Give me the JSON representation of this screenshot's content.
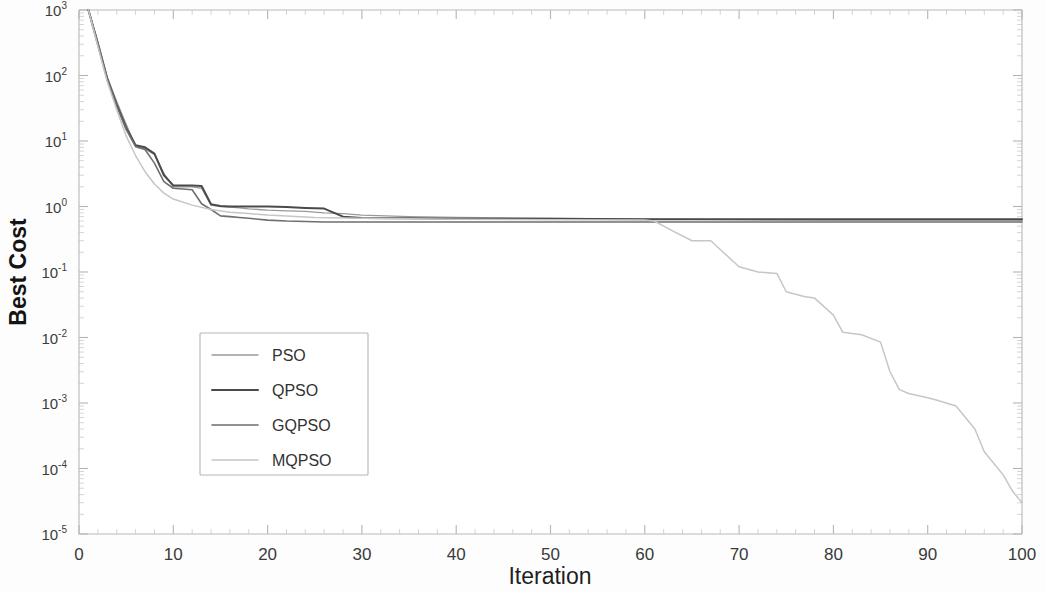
{
  "chart_data": {
    "type": "line",
    "title": "",
    "xlabel": "Iteration",
    "ylabel": "Best Cost",
    "yscale": "log",
    "xlim": [
      0,
      100
    ],
    "ylim": [
      1e-05,
      1000
    ],
    "grid": false,
    "legend_position": "center-left",
    "xtick_labels": [
      "0",
      "10",
      "20",
      "30",
      "40",
      "50",
      "60",
      "70",
      "80",
      "90",
      "100"
    ],
    "xticks": [
      0,
      10,
      20,
      30,
      40,
      50,
      60,
      70,
      80,
      90,
      100
    ],
    "ytick_labels": [
      "10-5",
      "10-4",
      "10-3",
      "10-2",
      "10-1",
      "100",
      "101",
      "102",
      "103"
    ],
    "ytick_mantissa": "10",
    "ytick_exponents": [
      "-5",
      "-4",
      "-3",
      "-2",
      "-1",
      "0",
      "1",
      "2",
      "3"
    ],
    "yticks": [
      1e-05,
      0.0001,
      0.001,
      0.01,
      0.1,
      1,
      10,
      100,
      1000
    ],
    "series": [
      {
        "name": "PSO",
        "color": "#9a9a9a",
        "width": 1.3,
        "x": [
          1,
          2,
          3,
          4,
          5,
          6,
          7,
          8,
          9,
          10,
          11,
          12,
          13,
          14,
          15,
          16,
          17,
          18,
          19,
          20,
          22,
          24,
          26,
          28,
          30,
          35,
          40,
          50,
          60,
          70,
          80,
          90,
          100
        ],
        "y": [
          1000,
          330,
          95,
          40,
          18,
          8.4,
          7.6,
          6.2,
          3.2,
          2.0,
          2.0,
          2.0,
          1.9,
          1.05,
          1.0,
          0.98,
          0.95,
          0.92,
          0.9,
          0.88,
          0.86,
          0.84,
          0.8,
          0.78,
          0.74,
          0.7,
          0.68,
          0.66,
          0.64,
          0.63,
          0.62,
          0.62,
          0.62
        ]
      },
      {
        "name": "QPSO",
        "color": "#4a4a4a",
        "width": 2.0,
        "x": [
          1,
          2,
          3,
          4,
          5,
          6,
          7,
          8,
          9,
          10,
          11,
          12,
          13,
          14,
          15,
          16,
          17,
          18,
          19,
          20,
          22,
          24,
          26,
          28,
          30,
          35,
          40,
          50,
          60,
          70,
          80,
          90,
          100
        ],
        "y": [
          1000,
          300,
          88,
          36,
          16,
          8.6,
          8.0,
          6.4,
          3.0,
          2.1,
          2.1,
          2.1,
          2.05,
          1.08,
          1.02,
          1.0,
          1.0,
          1.0,
          1.0,
          1.0,
          0.98,
          0.95,
          0.93,
          0.7,
          0.67,
          0.66,
          0.65,
          0.65,
          0.64,
          0.64,
          0.64,
          0.64,
          0.64
        ]
      },
      {
        "name": "GQPSO",
        "color": "#6e6e6e",
        "width": 1.6,
        "x": [
          1,
          2,
          3,
          4,
          5,
          6,
          7,
          8,
          9,
          10,
          11,
          12,
          13,
          14,
          15,
          16,
          17,
          18,
          19,
          20,
          22,
          24,
          26,
          28,
          30,
          35,
          40,
          50,
          60,
          70,
          80,
          90,
          100
        ],
        "y": [
          1000,
          310,
          90,
          34,
          15,
          8.2,
          7.4,
          4.6,
          2.4,
          1.9,
          1.85,
          1.8,
          1.1,
          0.9,
          0.72,
          0.7,
          0.68,
          0.66,
          0.64,
          0.62,
          0.6,
          0.59,
          0.58,
          0.58,
          0.58,
          0.58,
          0.58,
          0.58,
          0.58,
          0.58,
          0.58,
          0.58,
          0.58
        ]
      },
      {
        "name": "MQPSO",
        "color": "#c6c6c6",
        "width": 1.5,
        "x": [
          1,
          2,
          3,
          4,
          5,
          6,
          7,
          8,
          9,
          10,
          12,
          14,
          16,
          18,
          20,
          25,
          30,
          40,
          50,
          60,
          61,
          63,
          65,
          67,
          68,
          70,
          72,
          74,
          75,
          77,
          78,
          80,
          81,
          83,
          85,
          86,
          87,
          88,
          90,
          91,
          93,
          95,
          96,
          97,
          98,
          99,
          100
        ],
        "y": [
          1000,
          280,
          80,
          30,
          12,
          6.0,
          3.4,
          2.2,
          1.6,
          1.3,
          1.05,
          0.9,
          0.82,
          0.78,
          0.74,
          0.68,
          0.66,
          0.64,
          0.63,
          0.62,
          0.6,
          0.42,
          0.3,
          0.3,
          0.22,
          0.12,
          0.1,
          0.095,
          0.05,
          0.042,
          0.04,
          0.022,
          0.012,
          0.011,
          0.0085,
          0.003,
          0.0016,
          0.0014,
          0.0012,
          0.0011,
          0.0009,
          0.0004,
          0.00018,
          0.00012,
          8e-05,
          4.5e-05,
          3e-05
        ]
      }
    ]
  },
  "legend": {
    "entries": [
      {
        "label": "PSO"
      },
      {
        "label": "QPSO"
      },
      {
        "label": "GQPSO"
      },
      {
        "label": "MQPSO"
      }
    ]
  }
}
